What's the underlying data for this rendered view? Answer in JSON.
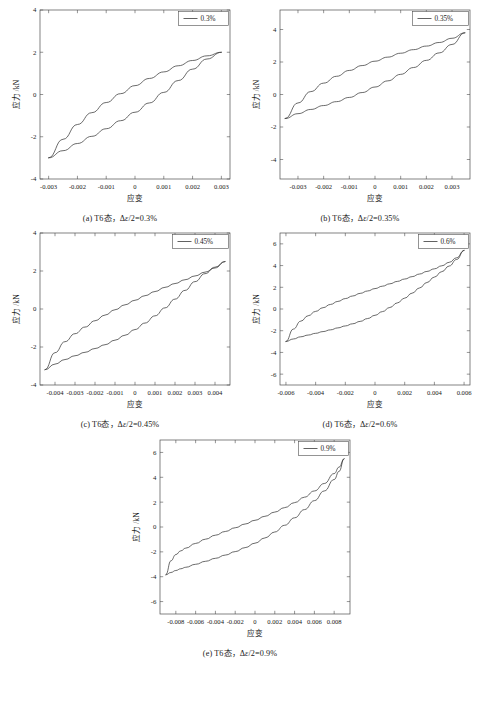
{
  "figure": {
    "axis_x_title": "应变",
    "axis_y_title": "应力 /kN"
  },
  "chart_data": [
    {
      "id": "a",
      "type": "line",
      "title": "",
      "caption_prefix": "(a) T6态，Δ",
      "caption_italic": "ε",
      "caption_suffix": "/2=0.3%",
      "legend": [
        "0.3%"
      ],
      "legend_position": "top-right",
      "grid": false,
      "xlabel": "应变",
      "ylabel": "应力 /kN",
      "xlim": [
        -0.0033,
        0.0033
      ],
      "ylim": [
        -4,
        4
      ],
      "xticks": [
        -0.003,
        -0.002,
        -0.001,
        0,
        0.001,
        0.002,
        0.003
      ],
      "xticklabels": [
        "-0.003",
        "-0.002",
        "-0.001",
        "0",
        "0.001",
        "0.002",
        "0.003"
      ],
      "yticks": [
        -4,
        -2,
        0,
        2,
        4
      ],
      "yticklabels": [
        "-4",
        "-2",
        "0",
        "2",
        "4"
      ],
      "series": [
        {
          "name": "0.3% upper (unloading)",
          "x": [
            -0.003,
            -0.0025,
            -0.002,
            -0.0015,
            -0.001,
            -0.0005,
            0,
            0.0005,
            0.001,
            0.0015,
            0.002,
            0.0025,
            0.003
          ],
          "y": [
            -3.0,
            -2.12,
            -1.42,
            -0.86,
            -0.38,
            0.04,
            0.42,
            0.76,
            1.07,
            1.36,
            1.61,
            1.83,
            2.0
          ]
        },
        {
          "name": "0.3% lower (loading)",
          "x": [
            -0.003,
            -0.0025,
            -0.002,
            -0.0015,
            -0.001,
            -0.0005,
            0,
            0.0005,
            0.001,
            0.0015,
            0.002,
            0.0025,
            0.003
          ],
          "y": [
            -3.0,
            -2.66,
            -2.32,
            -1.98,
            -1.62,
            -1.24,
            -0.84,
            -0.4,
            0.1,
            0.66,
            1.2,
            1.68,
            2.0
          ]
        }
      ]
    },
    {
      "id": "b",
      "type": "line",
      "title": "",
      "caption_prefix": "(b) T6态，Δ",
      "caption_italic": "ε",
      "caption_suffix": "/2=0.35%",
      "legend": [
        "0.35%"
      ],
      "legend_position": "top-right",
      "grid": false,
      "xlabel": "应变",
      "ylabel": "应力 /kN",
      "xlim": [
        -0.0037,
        0.0037
      ],
      "ylim": [
        -5.2,
        5.2
      ],
      "xticks": [
        -0.003,
        -0.002,
        -0.001,
        0,
        0.001,
        0.002,
        0.003
      ],
      "xticklabels": [
        "-0.003",
        "-0.002",
        "-0.001",
        "0",
        "0.001",
        "0.002",
        "0.003"
      ],
      "yticks": [
        -4,
        -2,
        0,
        2,
        4
      ],
      "yticklabels": [
        "-4",
        "-2",
        "0",
        "2",
        "4"
      ],
      "series": [
        {
          "name": "0.35% upper (unloading)",
          "x": [
            -0.0035,
            -0.003,
            -0.0025,
            -0.002,
            -0.0015,
            -0.001,
            -0.0005,
            0,
            0.0005,
            0.001,
            0.0015,
            0.002,
            0.0025,
            0.003,
            0.0035
          ],
          "y": [
            -1.48,
            -0.52,
            0.18,
            0.7,
            1.12,
            1.48,
            1.78,
            2.05,
            2.3,
            2.54,
            2.76,
            2.98,
            3.2,
            3.46,
            3.8
          ]
        },
        {
          "name": "0.35% lower (loading)",
          "x": [
            -0.0035,
            -0.003,
            -0.0025,
            -0.002,
            -0.0015,
            -0.001,
            -0.0005,
            0,
            0.0005,
            0.001,
            0.0015,
            0.002,
            0.0025,
            0.003,
            0.0035
          ],
          "y": [
            -1.48,
            -1.18,
            -0.92,
            -0.68,
            -0.44,
            -0.18,
            0.12,
            0.46,
            0.84,
            1.24,
            1.66,
            2.1,
            2.56,
            3.08,
            3.8
          ]
        }
      ]
    },
    {
      "id": "c",
      "type": "line",
      "title": "",
      "caption_prefix": "(c) T6态，Δ",
      "caption_italic": "ε",
      "caption_suffix": "/2=0.45%",
      "legend": [
        "0.45%"
      ],
      "legend_position": "top-right",
      "grid": false,
      "xlabel": "应变",
      "ylabel": "应力 /kN",
      "xlim": [
        -0.00475,
        0.00475
      ],
      "ylim": [
        -4,
        4
      ],
      "xticks": [
        -0.004,
        -0.003,
        -0.002,
        -0.001,
        0,
        0.001,
        0.002,
        0.003,
        0.004
      ],
      "xticklabels": [
        "-0.004",
        "-0.003",
        "-0.002",
        "-0.001",
        "0",
        "0.001",
        "0.002",
        "0.003",
        "0.004"
      ],
      "yticks": [
        -4,
        -2,
        0,
        2,
        4
      ],
      "yticklabels": [
        "-4",
        "-2",
        "0",
        "2",
        "4"
      ],
      "series": [
        {
          "name": "0.45% upper (unloading)",
          "x": [
            -0.0045,
            -0.004,
            -0.0035,
            -0.003,
            -0.0025,
            -0.002,
            -0.0015,
            -0.001,
            -0.0005,
            0,
            0.0005,
            0.001,
            0.0015,
            0.002,
            0.0025,
            0.003,
            0.0035,
            0.004,
            0.0045
          ],
          "y": [
            -3.2,
            -2.3,
            -1.72,
            -1.3,
            -0.95,
            -0.62,
            -0.32,
            -0.04,
            0.22,
            0.46,
            0.7,
            0.92,
            1.14,
            1.34,
            1.54,
            1.74,
            1.94,
            2.16,
            2.5
          ]
        },
        {
          "name": "0.45% lower (loading)",
          "x": [
            -0.0045,
            -0.004,
            -0.0035,
            -0.003,
            -0.0025,
            -0.002,
            -0.0015,
            -0.001,
            -0.0005,
            0,
            0.0005,
            0.001,
            0.0015,
            0.002,
            0.0025,
            0.003,
            0.0035,
            0.004,
            0.0045
          ],
          "y": [
            -3.2,
            -2.9,
            -2.66,
            -2.46,
            -2.28,
            -2.08,
            -1.88,
            -1.64,
            -1.38,
            -1.08,
            -0.74,
            -0.36,
            0.06,
            0.52,
            0.98,
            1.44,
            1.86,
            2.2,
            2.5
          ]
        }
      ]
    },
    {
      "id": "d",
      "type": "line",
      "title": "",
      "caption_prefix": "(d) T6态，Δ",
      "caption_italic": "ε",
      "caption_suffix": "/2=0.6%",
      "legend": [
        "0.6%"
      ],
      "legend_position": "top-right",
      "grid": false,
      "xlabel": "应变",
      "ylabel": "应力 /kN",
      "xlim": [
        -0.0064,
        0.0064
      ],
      "ylim": [
        -7,
        7
      ],
      "xticks": [
        -0.006,
        -0.004,
        -0.002,
        0,
        0.002,
        0.004,
        0.006
      ],
      "xticklabels": [
        "-0.006",
        "-0.004",
        "-0.002",
        "0",
        "0.002",
        "0.004",
        "0.006"
      ],
      "yticks": [
        -6,
        -4,
        -2,
        0,
        2,
        4,
        6
      ],
      "yticklabels": [
        "-6",
        "-4",
        "-2",
        "0",
        "2",
        "4",
        "6"
      ],
      "series": [
        {
          "name": "0.6% upper (unloading)",
          "x": [
            -0.006,
            -0.0055,
            -0.005,
            -0.0045,
            -0.004,
            -0.0035,
            -0.003,
            -0.0025,
            -0.002,
            -0.0015,
            -0.001,
            -0.0005,
            0,
            0.0005,
            0.001,
            0.0015,
            0.002,
            0.0025,
            0.003,
            0.0035,
            0.004,
            0.0045,
            0.005,
            0.0055,
            0.006
          ],
          "y": [
            -3.0,
            -1.85,
            -1.12,
            -0.62,
            -0.22,
            0.12,
            0.42,
            0.7,
            0.96,
            1.2,
            1.44,
            1.66,
            1.88,
            2.1,
            2.32,
            2.54,
            2.76,
            2.98,
            3.22,
            3.46,
            3.7,
            3.98,
            4.3,
            4.72,
            5.4
          ]
        },
        {
          "name": "0.6% lower (loading)",
          "x": [
            -0.006,
            -0.0055,
            -0.005,
            -0.0045,
            -0.004,
            -0.0035,
            -0.003,
            -0.0025,
            -0.002,
            -0.0015,
            -0.001,
            -0.0005,
            0,
            0.0005,
            0.001,
            0.0015,
            0.002,
            0.0025,
            0.003,
            0.0035,
            0.004,
            0.0045,
            0.005,
            0.0055,
            0.006
          ],
          "y": [
            -3.0,
            -2.76,
            -2.56,
            -2.4,
            -2.24,
            -2.08,
            -1.92,
            -1.74,
            -1.56,
            -1.36,
            -1.14,
            -0.88,
            -0.58,
            -0.24,
            0.14,
            0.56,
            1.0,
            1.46,
            1.94,
            2.44,
            2.94,
            3.44,
            3.96,
            4.56,
            5.4
          ]
        }
      ]
    },
    {
      "id": "e",
      "type": "line",
      "title": "",
      "caption_prefix": "(e) T6态，Δ",
      "caption_italic": "ε",
      "caption_suffix": "/2=0.9%",
      "legend": [
        "0.9%"
      ],
      "legend_position": "top-right",
      "grid": false,
      "xlabel": "应变",
      "ylabel": "应力 /kN",
      "xlim": [
        -0.0096,
        0.0096
      ],
      "ylim": [
        -7,
        7
      ],
      "xticks": [
        -0.008,
        -0.006,
        -0.004,
        -0.002,
        0,
        0.002,
        0.004,
        0.006,
        0.008
      ],
      "xticklabels": [
        "-0.008",
        "-0.006",
        "-0.004",
        "-0.002",
        "0",
        "0.002",
        "0.004",
        "0.006",
        "0.008"
      ],
      "yticks": [
        -6,
        -4,
        -2,
        0,
        2,
        4,
        6
      ],
      "yticklabels": [
        "-6",
        "-4",
        "-2",
        "0",
        "2",
        "4",
        "6"
      ],
      "series": [
        {
          "name": "0.9% upper (unloading)",
          "x": [
            -0.009,
            -0.0085,
            -0.008,
            -0.0075,
            -0.007,
            -0.006,
            -0.005,
            -0.004,
            -0.003,
            -0.002,
            -0.001,
            0,
            0.001,
            0.002,
            0.003,
            0.004,
            0.005,
            0.006,
            0.007,
            0.008,
            0.0085,
            0.009
          ],
          "y": [
            -3.85,
            -2.72,
            -2.22,
            -1.92,
            -1.7,
            -1.32,
            -0.98,
            -0.66,
            -0.36,
            -0.06,
            0.24,
            0.54,
            0.86,
            1.2,
            1.56,
            1.96,
            2.4,
            2.9,
            3.5,
            4.3,
            4.82,
            5.5
          ]
        },
        {
          "name": "0.9% lower (loading)",
          "x": [
            -0.009,
            -0.0085,
            -0.008,
            -0.0075,
            -0.007,
            -0.006,
            -0.005,
            -0.004,
            -0.003,
            -0.002,
            -0.001,
            0,
            0.001,
            0.002,
            0.003,
            0.004,
            0.005,
            0.006,
            0.007,
            0.008,
            0.0085,
            0.009
          ],
          "y": [
            -3.85,
            -3.66,
            -3.5,
            -3.36,
            -3.24,
            -3.0,
            -2.76,
            -2.52,
            -2.26,
            -1.98,
            -1.66,
            -1.3,
            -0.88,
            -0.4,
            0.14,
            0.74,
            1.4,
            2.12,
            2.9,
            3.82,
            4.48,
            5.5
          ]
        }
      ]
    }
  ]
}
